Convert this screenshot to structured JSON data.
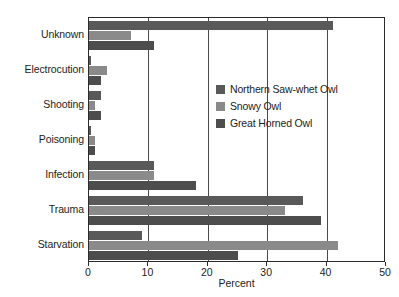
{
  "chart_data": {
    "type": "bar",
    "orientation": "horizontal",
    "title": "",
    "xlabel": "Percent",
    "ylabel": "",
    "xlim": [
      0,
      50
    ],
    "xticks": [
      0,
      10,
      20,
      30,
      40,
      50
    ],
    "xtick_labels": [
      "0",
      "10",
      "20",
      "30",
      "40",
      "50"
    ],
    "gridlines": [
      10,
      20,
      30,
      40
    ],
    "grid": true,
    "legend_position": "center-right-inside",
    "categories": [
      "Unknown",
      "Electrocution",
      "Shooting",
      "Poisoning",
      "Infection",
      "Trauma",
      "Starvation"
    ],
    "series": [
      {
        "name": "Northern Saw-whet Owl",
        "color": "#595959",
        "values": [
          41.0,
          0.3,
          2.0,
          0.3,
          11.0,
          36.0,
          9.0
        ]
      },
      {
        "name": "Snowy Owl",
        "color": "#8a8a8a",
        "values": [
          7.0,
          3.0,
          1.0,
          1.0,
          11.0,
          33.0,
          42.0
        ]
      },
      {
        "name": "Great Horned Owl",
        "color": "#4d4d4d",
        "values": [
          11.0,
          2.0,
          2.0,
          1.0,
          18.0,
          39.0,
          25.0
        ]
      }
    ]
  },
  "axis": {
    "frame_color": "#2b2b2b",
    "grid_color": "#4a4a4a",
    "text_color": "#1d1d1d"
  }
}
